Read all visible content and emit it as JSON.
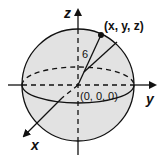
{
  "diagram": {
    "type": "sphere-in-3d-coordinates",
    "colors": {
      "sphere_fill": "#e2e2e2",
      "stroke": "#111111",
      "background": "#ffffff"
    },
    "axes": {
      "x_label": "x",
      "y_label": "y",
      "z_label": "z"
    },
    "point_label": "(x, y, z)",
    "origin_label": "(0, 0, 0)",
    "radius_label": "6"
  }
}
